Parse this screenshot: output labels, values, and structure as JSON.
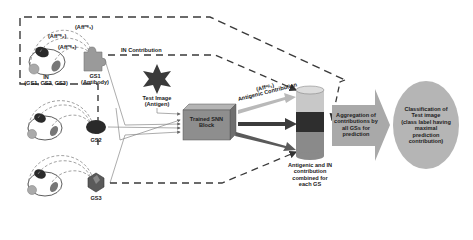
{
  "diagram": {
    "gene_sets": [
      {
        "id": "GS1",
        "label": "GS1",
        "sublabel": "(Antibody)",
        "shape": "puzzle-piece"
      },
      {
        "id": "GS2",
        "label": "GS2",
        "shape": "ellipse"
      },
      {
        "id": "GS3",
        "label": "GS3",
        "shape": "hexagon-cube"
      }
    ],
    "in_node": {
      "label": "IN",
      "sublabel": "(GS1, GS2, GS3)"
    },
    "affinity_labels": [
      "(Affᴵᴺ₁)",
      "(Affᴵᴺ₂)",
      "(Affᴵᴺ₃)"
    ],
    "affinity_labels_display": [
      "(Affⁿᵉ₁)",
      "(Affⁿᵉ₂)",
      "(Affⁿᵉ₃)"
    ],
    "in_contribution_label": "IN Contribution",
    "test_image": {
      "label": "Test Image",
      "sublabel": "(Antigen)",
      "shape": "six-point-star"
    },
    "snn_block": {
      "line1": "Trained SNN",
      "line2": "Block"
    },
    "antigenic_affinity_label": "(Affᵃᵍ₁)",
    "antigenic_contribution_label": "Antigenic Contribution",
    "cylinder_caption": [
      "Antigenic and IN",
      "contribution",
      "combined for",
      "each GS"
    ],
    "aggregation_arrow": [
      "Aggregation of",
      "contributions by",
      "all GSs for",
      "prediction"
    ],
    "classification": [
      "Classification of",
      "Test image",
      "(class label having",
      "maximal",
      "prediction",
      "contribution)"
    ],
    "colors": {
      "dashed_line": "#3a3a3a",
      "puzzle": "#9a9a9a",
      "star": "#3a3a3a",
      "snn_block_front": "#8e8e8e",
      "snn_block_top": "#b4b4b4",
      "snn_block_side": "#6f6f6f",
      "cylinder_top": "#c8c8c8",
      "cylinder_dark": "#2e2e2e",
      "cylinder_mid": "#7a7a7a",
      "arrow_light": "#b9b9b9",
      "arrow_dark": "#3c3c3c",
      "big_arrow": "#a9a9a9",
      "ellipse": "#b5b5b5"
    }
  }
}
